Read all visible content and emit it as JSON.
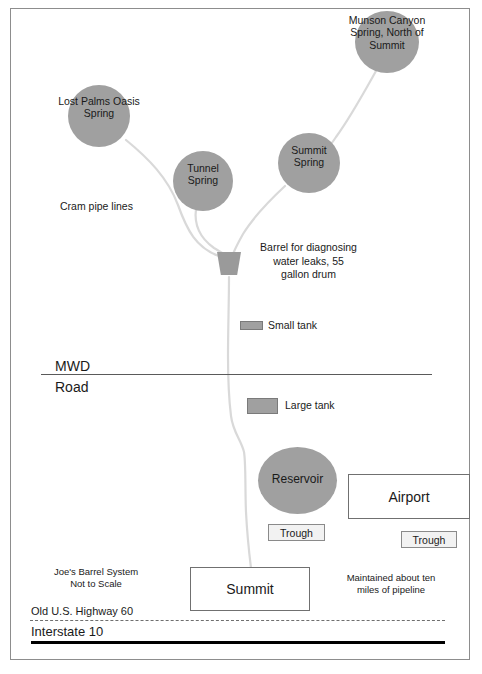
{
  "diagram": {
    "title": "Joe's Barrel System",
    "subtitle": "Not to Scale",
    "springs": [
      {
        "id": "lost-palms-oasis-spring",
        "label_line_1": "Lost Palms Oasis",
        "label_line_2": "Spring",
        "fill": "#a0a0a0"
      },
      {
        "id": "tunnel-spring",
        "label_line_1": "Tunnel",
        "label_line_2": "Spring",
        "fill": "#a0a0a0"
      },
      {
        "id": "summit-spring",
        "label_line_1": "Summit",
        "label_line_2": "Spring",
        "fill": "#a0a0a0"
      },
      {
        "id": "munson-canyon-spring",
        "label_line_1": "Munson Canyon",
        "label_line_2": "Spring, North of",
        "label_line_3": "Summit",
        "fill": "#a0a0a0"
      }
    ],
    "annotations": {
      "cram_pipe_lines": "Cram pipe lines",
      "barrel_line_1": "Barrel for diagnosing",
      "barrel_line_2": "water leaks, 55",
      "barrel_line_3": "gallon drum",
      "maintained_line_1": "Maintained about ten",
      "maintained_line_2": "miles of pipeline"
    },
    "legend": {
      "small_tank": "Small tank",
      "large_tank": "Large tank"
    },
    "road_mwd": {
      "above": "MWD",
      "below": "Road"
    },
    "reservoir": "Reservoir",
    "troughs": [
      {
        "id": "trough-reservoir",
        "label": "Trough"
      },
      {
        "id": "trough-airport",
        "label": "Trough"
      }
    ],
    "airport": "Airport",
    "summit_box": "Summit",
    "highways": {
      "old_highway": "Old U.S. Highway 60",
      "interstate": "Interstate 10"
    },
    "colors": {
      "node_fill": "#a0a0a0",
      "pipe": "#d9d9d9",
      "border": "#8d8d8d",
      "text": "#1a1a1a",
      "interstate": "#000000"
    }
  }
}
